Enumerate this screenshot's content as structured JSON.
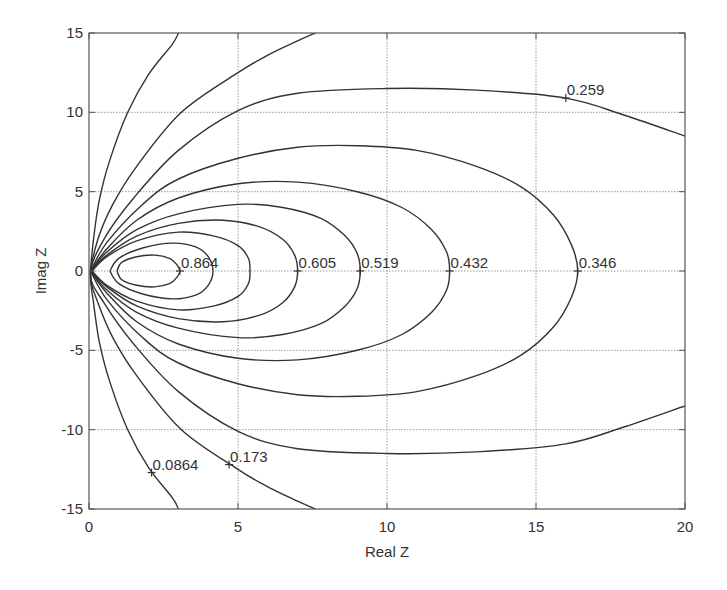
{
  "chart_data": {
    "type": "contour",
    "title": "",
    "xlabel": "Real  Z",
    "ylabel": "Imag  Z",
    "xlim": [
      0,
      20
    ],
    "ylim": [
      -15,
      15
    ],
    "xticks": [
      0,
      5,
      10,
      15,
      20
    ],
    "yticks": [
      -15,
      -10,
      -5,
      0,
      5,
      10,
      15
    ],
    "grid": true,
    "legend": null,
    "symmetric_about_real_axis": true,
    "colors": {
      "line": "#333333",
      "grid": "#9a9a9a",
      "frame": "#555555",
      "background": "#ffffff"
    },
    "contours": [
      {
        "level": 0.0864,
        "label": "0.0864",
        "label_at": [
          2.1,
          -12.7
        ],
        "closed": false,
        "upper": [
          [
            0.05,
            0.3
          ],
          [
            0.15,
            2.0
          ],
          [
            0.35,
            4.5
          ],
          [
            0.7,
            7.0
          ],
          [
            1.3,
            10.0
          ],
          [
            2.0,
            12.4
          ],
          [
            2.8,
            14.3
          ],
          [
            3.0,
            15.0
          ]
        ]
      },
      {
        "level": 0.173,
        "label": "0.173",
        "label_at": [
          4.7,
          -12.2
        ],
        "closed": false,
        "upper": [
          [
            0.05,
            0.3
          ],
          [
            0.3,
            2.0
          ],
          [
            0.8,
            4.2
          ],
          [
            1.6,
            6.6
          ],
          [
            3.1,
            10.0
          ],
          [
            5.0,
            12.5
          ],
          [
            6.0,
            13.6
          ],
          [
            7.0,
            14.5
          ],
          [
            7.6,
            15.0
          ]
        ]
      },
      {
        "level": 0.259,
        "label": "0.259",
        "label_at": [
          16.0,
          10.9
        ],
        "closed": false,
        "upper": [
          [
            0.05,
            0.2
          ],
          [
            0.5,
            2.0
          ],
          [
            1.5,
            4.6
          ],
          [
            3.0,
            7.6
          ],
          [
            5.0,
            10.1
          ],
          [
            7.0,
            11.2
          ],
          [
            10.0,
            11.5
          ],
          [
            13.0,
            11.4
          ],
          [
            16.0,
            10.9
          ],
          [
            18.0,
            9.8
          ],
          [
            20.0,
            8.5
          ]
        ]
      },
      {
        "level": 0.346,
        "label": "0.346",
        "label_at": [
          16.4,
          0
        ],
        "closed": true,
        "upper": [
          [
            0.05,
            0.0
          ],
          [
            0.6,
            1.8
          ],
          [
            1.8,
            4.2
          ],
          [
            3.0,
            5.8
          ],
          [
            5.0,
            7.1
          ],
          [
            7.0,
            7.8
          ],
          [
            9.0,
            7.9
          ],
          [
            11.0,
            7.6
          ],
          [
            13.0,
            6.6
          ],
          [
            14.5,
            5.3
          ],
          [
            15.6,
            3.5
          ],
          [
            16.2,
            1.6
          ],
          [
            16.4,
            0.0
          ]
        ]
      },
      {
        "level": 0.432,
        "label": "0.432",
        "label_at": [
          12.1,
          0
        ],
        "closed": true,
        "upper": [
          [
            0.05,
            0.0
          ],
          [
            0.6,
            1.4
          ],
          [
            1.6,
            3.2
          ],
          [
            3.0,
            4.6
          ],
          [
            5.0,
            5.5
          ],
          [
            7.0,
            5.6
          ],
          [
            9.0,
            5.0
          ],
          [
            10.5,
            4.0
          ],
          [
            11.5,
            2.6
          ],
          [
            12.0,
            1.2
          ],
          [
            12.1,
            0.0
          ]
        ]
      },
      {
        "level": 0.519,
        "label": "0.519",
        "label_at": [
          9.1,
          0
        ],
        "closed": true,
        "upper": [
          [
            0.05,
            0.0
          ],
          [
            0.6,
            1.2
          ],
          [
            1.6,
            2.6
          ],
          [
            3.0,
            3.6
          ],
          [
            5.0,
            4.2
          ],
          [
            6.5,
            4.0
          ],
          [
            7.8,
            3.3
          ],
          [
            8.6,
            2.2
          ],
          [
            9.0,
            1.1
          ],
          [
            9.1,
            0.0
          ]
        ]
      },
      {
        "level": 0.605,
        "label": "0.605",
        "label_at": [
          7.0,
          0
        ],
        "closed": true,
        "upper": [
          [
            0.05,
            0.0
          ],
          [
            0.6,
            1.0
          ],
          [
            1.6,
            2.2
          ],
          [
            3.0,
            3.0
          ],
          [
            4.5,
            3.2
          ],
          [
            5.7,
            2.8
          ],
          [
            6.5,
            2.0
          ],
          [
            6.9,
            1.0
          ],
          [
            7.0,
            0.0
          ]
        ]
      },
      {
        "level": 0.691,
        "label": "",
        "label_at": null,
        "closed": true,
        "upper": [
          [
            0.1,
            0.0
          ],
          [
            0.6,
            0.9
          ],
          [
            1.6,
            1.9
          ],
          [
            3.0,
            2.45
          ],
          [
            4.2,
            2.2
          ],
          [
            5.0,
            1.6
          ],
          [
            5.35,
            0.8
          ],
          [
            5.4,
            0.0
          ]
        ]
      },
      {
        "level": 0.778,
        "label": "",
        "label_at": null,
        "closed": true,
        "upper": [
          [
            0.7,
            0.0
          ],
          [
            1.0,
            0.8
          ],
          [
            1.8,
            1.45
          ],
          [
            2.8,
            1.76
          ],
          [
            3.6,
            1.5
          ],
          [
            4.0,
            0.9
          ],
          [
            4.16,
            0.0
          ]
        ]
      },
      {
        "level": 0.864,
        "label": "0.864",
        "label_at": [
          3.05,
          0
        ],
        "closed": true,
        "upper": [
          [
            0.94,
            0.0
          ],
          [
            1.1,
            0.55
          ],
          [
            1.6,
            0.9
          ],
          [
            2.2,
            1.0
          ],
          [
            2.7,
            0.8
          ],
          [
            2.95,
            0.4
          ],
          [
            3.05,
            0.0
          ]
        ]
      }
    ]
  }
}
